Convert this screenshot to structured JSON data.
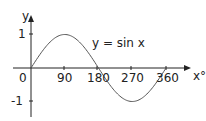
{
  "chart_data": {
    "type": "line",
    "title": "",
    "xlabel": "x°",
    "ylabel": "y",
    "annotation": "y = sin x",
    "x_ticks": [
      "0",
      "90",
      "180",
      "270",
      "360"
    ],
    "y_ticks": [
      "1",
      "-1"
    ],
    "x": [
      0,
      30,
      60,
      90,
      120,
      150,
      180,
      210,
      240,
      270,
      300,
      330,
      360
    ],
    "series": [
      {
        "name": "y = sin x",
        "values": [
          0,
          0.5,
          0.866,
          1,
          0.866,
          0.5,
          0,
          -0.5,
          -0.866,
          -1,
          -0.866,
          -0.5,
          0
        ]
      }
    ],
    "xlim": [
      0,
      360
    ],
    "ylim": [
      -1,
      1
    ],
    "grid": false,
    "legend": "none",
    "colors": {
      "curve": "#555555",
      "axes": "#222222"
    }
  }
}
